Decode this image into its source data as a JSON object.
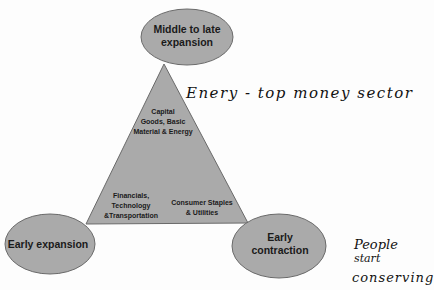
{
  "diagram": {
    "colors": {
      "background": "#fdfdfd",
      "shape_fill": "#aaaaaa",
      "shape_stroke": "#6a6a6a",
      "text": "#1a1a1a",
      "handwriting": "#111111"
    },
    "phases": {
      "top": {
        "line1": "Middle to late",
        "line2": "expansion"
      },
      "bottom_left": {
        "line1": "Early expansion"
      },
      "bottom_right": {
        "line1": "Early",
        "line2": "contraction"
      }
    },
    "sectors": {
      "top": {
        "line1": "Capital",
        "line2": "Goods, Basic",
        "line3": "Material & Energy"
      },
      "bottom_left": {
        "line1": "Financials,",
        "line2": "Technology",
        "line3": "&Transportation"
      },
      "bottom_right": {
        "line1": "Consumer Staples",
        "line2": "& Utilities"
      }
    },
    "annotations": {
      "energy_note": "Enery - top money sector",
      "conserving_note": {
        "line1": "People",
        "line2": "start",
        "line3": "conserving"
      }
    }
  }
}
